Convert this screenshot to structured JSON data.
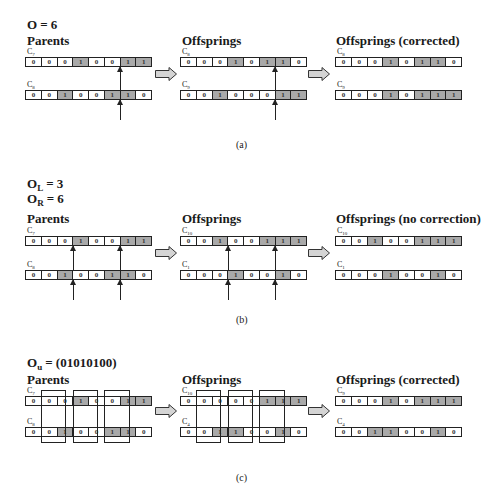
{
  "colors": {
    "gene_one": "#a9a9a9",
    "gene_zero": "#ffffff",
    "border": "#222222",
    "arrow_fill": "#d4d4d4"
  },
  "panels": {
    "a": {
      "caption": "(a)",
      "params": [
        {
          "sym": "O",
          "sub": "",
          "value": "= 6"
        }
      ],
      "columns": [
        {
          "heading": "Parents",
          "rows": [
            {
              "name": "C",
              "sub": "7",
              "genes": [
                0,
                0,
                0,
                1,
                0,
                0,
                1,
                1
              ]
            },
            {
              "name": "C",
              "sub": "8",
              "genes": [
                0,
                0,
                1,
                0,
                0,
                1,
                1,
                0
              ]
            }
          ]
        },
        {
          "heading": "Offsprings",
          "rows": [
            {
              "name": "C",
              "sub": "8",
              "genes": [
                0,
                0,
                0,
                1,
                0,
                1,
                1,
                0
              ]
            },
            {
              "name": "C",
              "sub": "9",
              "genes": [
                0,
                0,
                1,
                0,
                0,
                0,
                1,
                1
              ]
            }
          ]
        },
        {
          "heading": "Offsprings (corrected)",
          "rows": [
            {
              "name": "C",
              "sub": "8",
              "genes": [
                0,
                0,
                0,
                1,
                0,
                1,
                1,
                0
              ]
            },
            {
              "name": "C",
              "sub": "9",
              "genes": [
                0,
                0,
                0,
                1,
                0,
                1,
                1,
                1
              ]
            }
          ]
        }
      ],
      "crossover_points": [
        6
      ]
    },
    "b": {
      "caption": "(b)",
      "params": [
        {
          "sym": "O",
          "sub": "L",
          "value": "= 3"
        },
        {
          "sym": "O",
          "sub": "R",
          "value": "= 6"
        }
      ],
      "columns": [
        {
          "heading": "Parents",
          "rows": [
            {
              "name": "C",
              "sub": "7",
              "genes": [
                0,
                0,
                0,
                1,
                0,
                0,
                1,
                1
              ]
            },
            {
              "name": "C",
              "sub": "8",
              "genes": [
                0,
                0,
                1,
                0,
                0,
                1,
                1,
                0
              ]
            }
          ]
        },
        {
          "heading": "Offsprings",
          "rows": [
            {
              "name": "C",
              "sub": "10",
              "genes": [
                0,
                0,
                1,
                0,
                0,
                1,
                1,
                1
              ]
            },
            {
              "name": "C",
              "sub": "1",
              "genes": [
                0,
                0,
                0,
                1,
                0,
                0,
                1,
                0
              ]
            }
          ]
        },
        {
          "heading": "Offsprings (no correction)",
          "rows": [
            {
              "name": "C",
              "sub": "10",
              "genes": [
                0,
                0,
                1,
                0,
                0,
                1,
                1,
                1
              ]
            },
            {
              "name": "C",
              "sub": "1",
              "genes": [
                0,
                0,
                0,
                1,
                0,
                0,
                1,
                0
              ]
            }
          ]
        }
      ],
      "crossover_points": [
        3,
        6
      ]
    },
    "c": {
      "caption": "(c)",
      "params": [
        {
          "sym": "O",
          "sub": "u",
          "value": "= (01010100)"
        }
      ],
      "columns": [
        {
          "heading": "Parents",
          "rows": [
            {
              "name": "C",
              "sub": "7",
              "genes": [
                0,
                0,
                0,
                1,
                0,
                0,
                1,
                1
              ]
            },
            {
              "name": "C",
              "sub": "8",
              "genes": [
                0,
                0,
                1,
                0,
                0,
                1,
                1,
                0
              ]
            }
          ]
        },
        {
          "heading": "Offsprings",
          "rows": [
            {
              "name": "C",
              "sub": "10",
              "genes": [
                0,
                0,
                0,
                0,
                0,
                1,
                1,
                1
              ]
            },
            {
              "name": "C",
              "sub": "4",
              "genes": [
                0,
                0,
                1,
                1,
                0,
                0,
                1,
                0
              ]
            }
          ]
        },
        {
          "heading": "Offsprings (corrected)",
          "rows": [
            {
              "name": "C",
              "sub": "9",
              "genes": [
                0,
                0,
                0,
                1,
                0,
                1,
                1,
                1
              ]
            },
            {
              "name": "C",
              "sub": "4",
              "genes": [
                0,
                0,
                1,
                1,
                0,
                0,
                1,
                0
              ]
            }
          ]
        }
      ],
      "uniform_mask": "01010100",
      "mask_positions": [
        1,
        3,
        5
      ]
    }
  }
}
